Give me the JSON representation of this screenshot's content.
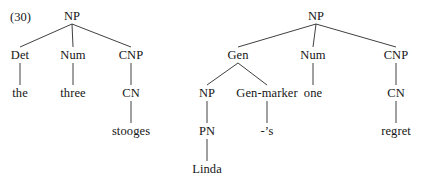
{
  "figure": {
    "example_number": "(30)",
    "background_color": "#ffffff",
    "text_color": "#161616",
    "line_color": "#2a2a2a",
    "width": 425,
    "height": 182
  },
  "trees": [
    {
      "id": "tree-left",
      "gloss": "the three stooges",
      "nodes": [
        {
          "key": "l_np",
          "label": "NP",
          "x": 72,
          "y": 16
        },
        {
          "key": "l_det",
          "label": "Det",
          "x": 20,
          "y": 55
        },
        {
          "key": "l_num",
          "label": "Num",
          "x": 73,
          "y": 55
        },
        {
          "key": "l_cnp",
          "label": "CNP",
          "x": 131,
          "y": 55
        },
        {
          "key": "l_the",
          "label": "the",
          "x": 20,
          "y": 93
        },
        {
          "key": "l_three",
          "label": "three",
          "x": 73,
          "y": 93
        },
        {
          "key": "l_cn",
          "label": "CN",
          "x": 131,
          "y": 93
        },
        {
          "key": "l_stooges",
          "label": "stooges",
          "x": 131,
          "y": 131
        }
      ],
      "edges": [
        {
          "from": "l_np",
          "to": "l_det"
        },
        {
          "from": "l_np",
          "to": "l_num"
        },
        {
          "from": "l_np",
          "to": "l_cnp"
        },
        {
          "from": "l_det",
          "to": "l_the"
        },
        {
          "from": "l_num",
          "to": "l_three"
        },
        {
          "from": "l_cnp",
          "to": "l_cn"
        },
        {
          "from": "l_cn",
          "to": "l_stooges"
        }
      ]
    },
    {
      "id": "tree-right",
      "gloss": "Linda's one regret",
      "nodes": [
        {
          "key": "r_np",
          "label": "NP",
          "x": 316,
          "y": 16
        },
        {
          "key": "r_gen",
          "label": "Gen",
          "x": 238,
          "y": 55
        },
        {
          "key": "r_num",
          "label": "Num",
          "x": 313,
          "y": 55
        },
        {
          "key": "r_cnp",
          "label": "CNP",
          "x": 396,
          "y": 55
        },
        {
          "key": "r_np2",
          "label": "NP",
          "x": 207,
          "y": 93
        },
        {
          "key": "r_genmk",
          "label": "Gen-marker",
          "x": 267,
          "y": 93
        },
        {
          "key": "r_one",
          "label": "one",
          "x": 313,
          "y": 93
        },
        {
          "key": "r_cn",
          "label": "CN",
          "x": 396,
          "y": 93
        },
        {
          "key": "r_pn",
          "label": "PN",
          "x": 207,
          "y": 131
        },
        {
          "key": "r_s",
          "label": "-’s",
          "x": 267,
          "y": 131
        },
        {
          "key": "r_regret",
          "label": "regret",
          "x": 396,
          "y": 131
        },
        {
          "key": "r_linda",
          "label": "Linda",
          "x": 207,
          "y": 169
        }
      ],
      "edges": [
        {
          "from": "r_np",
          "to": "r_gen"
        },
        {
          "from": "r_np",
          "to": "r_num"
        },
        {
          "from": "r_np",
          "to": "r_cnp"
        },
        {
          "from": "r_gen",
          "to": "r_np2"
        },
        {
          "from": "r_gen",
          "to": "r_genmk"
        },
        {
          "from": "r_num",
          "to": "r_one"
        },
        {
          "from": "r_cnp",
          "to": "r_cn"
        },
        {
          "from": "r_np2",
          "to": "r_pn"
        },
        {
          "from": "r_genmk",
          "to": "r_s"
        },
        {
          "from": "r_cn",
          "to": "r_regret"
        },
        {
          "from": "r_pn",
          "to": "r_linda"
        }
      ]
    }
  ]
}
